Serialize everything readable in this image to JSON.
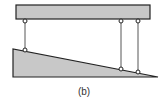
{
  "figure": {
    "caption": "(b)",
    "colors": {
      "fill": "#c8c8c8",
      "stroke": "#222222"
    },
    "beam": {
      "x": 16,
      "y": 5,
      "width": 134,
      "height": 14
    },
    "wedge": {
      "points": [
        [
          13,
          49
        ],
        [
          13,
          77
        ],
        [
          158,
          77
        ]
      ]
    },
    "links": [
      {
        "x": 25,
        "top": 21,
        "bottom": 50
      },
      {
        "x": 121,
        "top": 21,
        "bottom": 69
      },
      {
        "x": 138,
        "top": 21,
        "bottom": 72
      }
    ]
  }
}
